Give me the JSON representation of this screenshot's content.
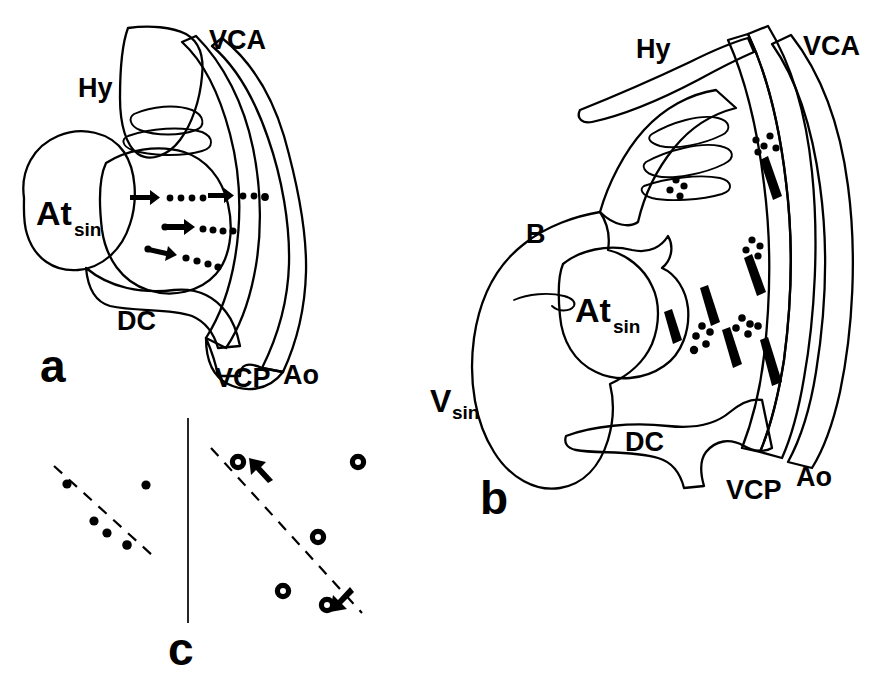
{
  "figure": {
    "panels": [
      {
        "id": "a",
        "label": "a"
      },
      {
        "id": "b",
        "label": "b"
      },
      {
        "id": "c",
        "label": "c"
      }
    ]
  },
  "panel_a": {
    "label": "a",
    "labels": {
      "hy": "Hy",
      "vca": "VCA",
      "at": "At",
      "at_sub": "sin",
      "dc": "DC",
      "vcp": "VCP",
      "ao": "Ao"
    },
    "annotation": {
      "arrow_trails": 3,
      "arrow_trail_description": "three solid arrows with trailing dot-dash tracks directed rightward from the atrium"
    }
  },
  "panel_b": {
    "label": "b",
    "labels": {
      "hy": "Hy",
      "vca": "VCA",
      "b_cavity": "B",
      "at": "At",
      "at_sub": "sin",
      "v": "V",
      "v_sub": "sin",
      "dc": "DC",
      "vcp": "VCP",
      "ao": "Ao"
    },
    "annotation": {
      "dash_marks": 6,
      "dot_clusters": 5,
      "dash_mark_description": "elongated black dashes and dot clusters indicating labelled migrating cells"
    }
  },
  "panel_c": {
    "label": "c",
    "divider": "vertical separator line",
    "left_group": {
      "marker": "filled-dot",
      "count": 5,
      "regression_line": "dashed",
      "points": [
        {
          "x": 67,
          "y": 484
        },
        {
          "x": 107,
          "y": 533
        },
        {
          "x": 94,
          "y": 521
        },
        {
          "x": 127,
          "y": 545
        },
        {
          "x": 146,
          "y": 485
        }
      ]
    },
    "right_group": {
      "marker": "open-circle",
      "count": 5,
      "regression_line": "dashed",
      "arrows": 2,
      "points": [
        {
          "x": 238,
          "y": 462
        },
        {
          "x": 318,
          "y": 537
        },
        {
          "x": 283,
          "y": 591
        },
        {
          "x": 327,
          "y": 605
        },
        {
          "x": 358,
          "y": 462
        }
      ]
    }
  },
  "colors": {
    "ink": "#000000",
    "background": "#ffffff"
  }
}
